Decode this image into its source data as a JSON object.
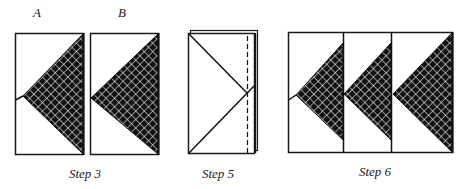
{
  "figure": {
    "colors": {
      "stroke": "#1a1a1a",
      "fill": "#111111",
      "grid": "#ffffff",
      "background": "#ffffff"
    },
    "panel_labels": {
      "a": "A",
      "b": "B"
    },
    "captions": {
      "step3": "Step 3",
      "step5": "Step 5",
      "step6": "Step 6"
    },
    "steps": [
      {
        "id": "step3",
        "caption": "Step 3",
        "panels": [
          "A",
          "B"
        ],
        "pattern": "crosshatched triangle"
      },
      {
        "id": "step5",
        "caption": "Step 5",
        "panels": [
          "folded stack with X lines and dashed fold line"
        ]
      },
      {
        "id": "step6",
        "caption": "Step 6",
        "panels": [
          "three units joined with crosshatched triangles"
        ]
      }
    ]
  }
}
